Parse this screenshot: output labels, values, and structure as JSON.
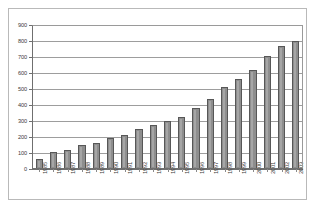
{
  "chart_data": {
    "type": "bar",
    "title": "",
    "subtitle": "",
    "xlabel": "",
    "ylabel": "",
    "grid": true,
    "legend": false,
    "legend_position": "none",
    "ylim": [
      0,
      900
    ],
    "ytick_step": 100,
    "yticks": [
      "0",
      "100",
      "200",
      "300",
      "400",
      "500",
      "600",
      "700",
      "800",
      "900"
    ],
    "categories": [
      "1985",
      "1986",
      "1987",
      "1988",
      "1989",
      "1990",
      "1991",
      "1992",
      "1993",
      "1994",
      "1995",
      "1996",
      "1997",
      "1998",
      "1999",
      "2000",
      "2001",
      "2002",
      "2003"
    ],
    "values": [
      65,
      105,
      120,
      147,
      163,
      192,
      215,
      252,
      277,
      297,
      325,
      380,
      435,
      510,
      565,
      618,
      708,
      770,
      800
    ],
    "series": [
      {
        "name": "",
        "values": [
          65,
          105,
          120,
          147,
          163,
          192,
          215,
          252,
          277,
          297,
          325,
          380,
          435,
          510,
          565,
          618,
          708,
          770,
          800
        ]
      }
    ],
    "colors": {
      "bar_fill": "#8e8e8e",
      "bar_outline": "#575757",
      "gridline": "#9d9d9d",
      "axis": "#6f6f6f",
      "frame": "#b9b9b9",
      "background": "#ffffff",
      "text": "#3a3a3a"
    }
  }
}
